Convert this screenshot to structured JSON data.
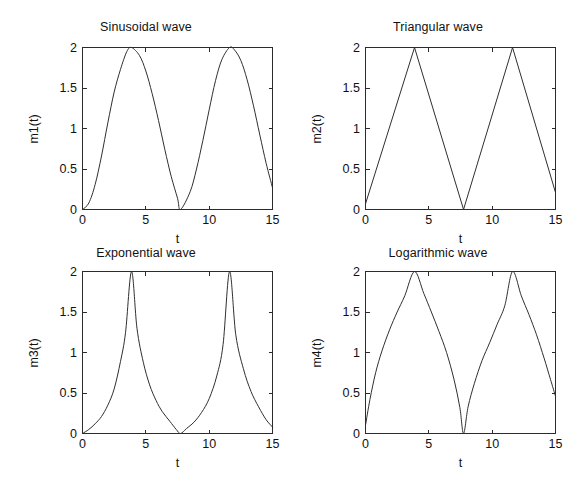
{
  "figure": {
    "background": "#ffffff",
    "line_color": "#2f2f2f",
    "axis_color": "#2b2b2b",
    "layout": "2x2 subplot grid"
  },
  "chart_data": [
    {
      "type": "line",
      "id": "sinusoidal",
      "title": "Sinusoidal wave",
      "xlabel": "t",
      "ylabel": "m1(t)",
      "xlim": [
        0,
        15
      ],
      "ylim": [
        0,
        2
      ],
      "xticks": [
        0,
        5,
        10,
        15
      ],
      "xticklabels": [
        "0",
        "5",
        "10",
        "15"
      ],
      "yticks": [
        0,
        0.5,
        1,
        1.5,
        2
      ],
      "yticklabels": [
        "0",
        "0.5",
        "1",
        "1.5",
        "2"
      ],
      "grid": false,
      "legend": null,
      "formula": "1 - cos(2*pi*t/7.74)",
      "period": 7.74,
      "amplitude": 2,
      "peaks_at": [
        3.87,
        11.61
      ],
      "zeros_at": [
        0,
        7.74
      ],
      "x": [
        0,
        0.5,
        1,
        1.5,
        2,
        2.5,
        3,
        3.5,
        3.87,
        4.5,
        5,
        5.5,
        6,
        6.5,
        7,
        7.5,
        7.74,
        8.5,
        9,
        9.5,
        10,
        10.5,
        11,
        11.61,
        12,
        12.5,
        13,
        13.5,
        14,
        14.5,
        15
      ],
      "y": [
        0,
        0.08,
        0.31,
        0.66,
        1.07,
        1.45,
        1.73,
        1.95,
        2.0,
        1.9,
        1.71,
        1.43,
        1.1,
        0.74,
        0.41,
        0.14,
        0.0,
        0.22,
        0.5,
        0.85,
        1.23,
        1.59,
        1.85,
        2.0,
        1.97,
        1.84,
        1.6,
        1.28,
        0.92,
        0.57,
        0.27
      ]
    },
    {
      "type": "line",
      "id": "triangular",
      "title": "Triangular wave",
      "xlabel": "t",
      "ylabel": "m2(t)",
      "xlim": [
        0,
        15
      ],
      "ylim": [
        0,
        2
      ],
      "xticks": [
        0,
        5,
        10,
        15
      ],
      "xticklabels": [
        "0",
        "5",
        "10",
        "15"
      ],
      "yticks": [
        0,
        0.5,
        1,
        1.5,
        2
      ],
      "yticklabels": [
        "0",
        "0.5",
        "1",
        "1.5",
        "2"
      ],
      "grid": false,
      "legend": null,
      "formula": "triangle wave, linear ramp up then down",
      "period": 7.74,
      "amplitude": 2,
      "peaks_at": [
        3.87,
        11.61
      ],
      "zeros_at": [
        0,
        7.74
      ],
      "x": [
        0,
        3.87,
        7.74,
        11.61,
        15
      ],
      "y": [
        0.07,
        2.0,
        0.0,
        2.0,
        0.21
      ]
    },
    {
      "type": "line",
      "id": "exponential",
      "title": "Exponential wave",
      "xlabel": "t",
      "ylabel": "m3(t)",
      "xlim": [
        0,
        15
      ],
      "ylim": [
        0,
        2
      ],
      "xticks": [
        0,
        5,
        10,
        15
      ],
      "xticklabels": [
        "0",
        "5",
        "10",
        "15"
      ],
      "yticks": [
        0,
        0.5,
        1,
        1.5,
        2
      ],
      "yticklabels": [
        "0",
        "0.5",
        "1",
        "1.5",
        "2"
      ],
      "grid": false,
      "legend": null,
      "formula": "2*exp(k*(|phase|-1)) convex exponential rise and decay",
      "period": 7.74,
      "amplitude": 2,
      "peaks_at": [
        3.87,
        11.61
      ],
      "zeros_at": [
        0,
        7.74
      ],
      "x": [
        0,
        0.5,
        1,
        1.5,
        2,
        2.5,
        3,
        3.4,
        3.87,
        4.3,
        4.8,
        5.3,
        5.8,
        6.3,
        6.9,
        7.4,
        7.74,
        8.2,
        8.8,
        9.4,
        10,
        10.6,
        11.1,
        11.61,
        12.1,
        12.7,
        13.3,
        13.9,
        14.5,
        15
      ],
      "y": [
        0.0,
        0.05,
        0.12,
        0.21,
        0.35,
        0.55,
        0.89,
        1.25,
        2.0,
        1.3,
        0.88,
        0.6,
        0.41,
        0.27,
        0.15,
        0.05,
        0.0,
        0.06,
        0.14,
        0.26,
        0.43,
        0.71,
        1.1,
        2.0,
        1.22,
        0.8,
        0.52,
        0.33,
        0.17,
        0.08
      ]
    },
    {
      "type": "line",
      "id": "logarithmic",
      "title": "Logarithmic wave",
      "xlabel": "t",
      "ylabel": "m4(t)",
      "xlim": [
        0,
        15
      ],
      "ylim": [
        0,
        2
      ],
      "xticks": [
        0,
        5,
        10,
        15
      ],
      "xticklabels": [
        "0",
        "5",
        "10",
        "15"
      ],
      "yticks": [
        0,
        0.5,
        1,
        1.5,
        2
      ],
      "yticklabels": [
        "0",
        "0.5",
        "1",
        "1.5",
        "2"
      ],
      "grid": false,
      "legend": null,
      "formula": "2*log(1+k*phase)/log(1+k) concave logarithmic rise and fall",
      "period": 7.74,
      "amplitude": 2,
      "peaks_at": [
        3.87,
        11.61
      ],
      "zeros_at": [
        0,
        7.74
      ],
      "x": [
        0,
        0.35,
        0.8,
        1.3,
        1.9,
        2.5,
        3.1,
        3.87,
        4.6,
        5.2,
        5.8,
        6.4,
        7,
        7.45,
        7.74,
        8.1,
        8.6,
        9.2,
        9.8,
        10.4,
        11,
        11.61,
        12.3,
        12.9,
        13.5,
        14.1,
        14.6,
        15
      ],
      "y": [
        0.1,
        0.42,
        0.75,
        1.02,
        1.28,
        1.5,
        1.7,
        2.0,
        1.73,
        1.5,
        1.26,
        1.0,
        0.66,
        0.32,
        0.0,
        0.33,
        0.62,
        0.9,
        1.12,
        1.35,
        1.58,
        2.0,
        1.7,
        1.47,
        1.22,
        0.93,
        0.67,
        0.46
      ]
    }
  ]
}
